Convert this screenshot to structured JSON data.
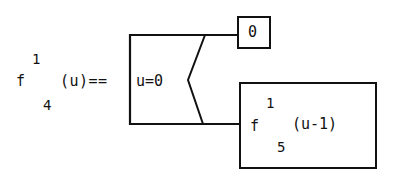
{
  "definition": {
    "func_name": "f",
    "func_sup": "1",
    "func_sub": "4",
    "args_and_op": "(u)=="
  },
  "condition": {
    "text": "u=0"
  },
  "true_branch": {
    "value": "0"
  },
  "false_branch": {
    "func_name": "f",
    "func_sup": "1",
    "func_sub": "5",
    "args": "(u-1)"
  },
  "colors": {
    "ink": "#111111",
    "background": "#ffffff"
  }
}
